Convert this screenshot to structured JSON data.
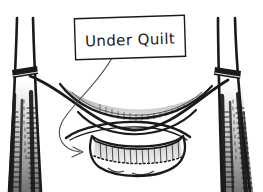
{
  "diagram": {
    "style": "hand-drawn black ink line art",
    "background_color": "#ffffff",
    "ink_color": "#1a1a1a",
    "shade_color": "#b5b5b5",
    "callout": {
      "label": "Under Quilt",
      "box": {
        "x": 75,
        "y": 17,
        "width": 110,
        "height": 41,
        "rotation_deg": -2,
        "stroke_color": "#1a1a1a",
        "fill_color": "#ffffff"
      },
      "leader_line": {
        "from": [
          112,
          58
        ],
        "to": [
          84,
          152
        ],
        "arrow_direction": "right"
      }
    },
    "elements": [
      {
        "name": "tree-trunk-left",
        "side": "left",
        "x_top": 17,
        "x_bottom": 10
      },
      {
        "name": "tree-trunk-right",
        "side": "right",
        "x_top": 218,
        "x_bottom": 240
      },
      {
        "name": "strap-left",
        "y": 72
      },
      {
        "name": "strap-right",
        "y": 76
      },
      {
        "name": "hammock",
        "sag_depth": 48
      },
      {
        "name": "under-quilt",
        "attached_below": "hammock"
      }
    ]
  }
}
